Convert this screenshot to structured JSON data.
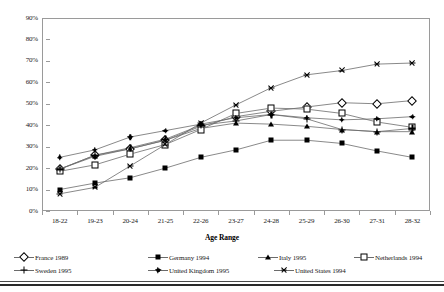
{
  "chart_data": {
    "type": "line",
    "title": "",
    "xlabel": "Age Range",
    "ylabel": "",
    "ylim": [
      0,
      90
    ],
    "grid": false,
    "legend_position": "bottom",
    "categories": [
      "18-22",
      "19-23",
      "20-24",
      "21-25",
      "22-26",
      "23-27",
      "24-28",
      "25-29",
      "26-30",
      "27-31",
      "28-32"
    ],
    "ytick_labels": [
      "90%",
      "80%",
      "70%",
      "60%",
      "50%",
      "40%",
      "30%",
      "20%",
      "10%",
      "0%"
    ],
    "ytick_values": [
      90,
      80,
      70,
      60,
      50,
      40,
      30,
      20,
      10,
      0
    ],
    "series": [
      {
        "name": "France 1989",
        "marker": "diamond-open",
        "values": [
          19.5,
          26.0,
          29.0,
          33.0,
          39.5,
          44.0,
          46.5,
          48.5,
          50.5,
          50.0,
          51.5
        ]
      },
      {
        "name": "Germany 1994",
        "marker": "square-filled",
        "values": [
          10.0,
          13.0,
          15.5,
          20.0,
          25.0,
          28.5,
          33.0,
          33.0,
          31.5,
          28.0,
          25.0
        ]
      },
      {
        "name": "Italy 1995",
        "marker": "triangle-filled",
        "values": [
          19.5,
          25.5,
          29.0,
          33.0,
          38.5,
          41.0,
          40.5,
          39.5,
          38.0,
          37.0,
          37.0
        ]
      },
      {
        "name": "Netherlands 1994",
        "marker": "square-open",
        "values": [
          18.5,
          21.5,
          26.5,
          31.0,
          38.0,
          45.5,
          48.0,
          47.5,
          45.5,
          41.5,
          39.0
        ]
      },
      {
        "name": "Sweden 1995",
        "marker": "starburst",
        "values": [
          19.5,
          26.0,
          29.5,
          33.5,
          40.0,
          42.0,
          45.0,
          43.0,
          38.0,
          37.0,
          38.5
        ]
      },
      {
        "name": "United Kingdom 1995",
        "marker": "dot-plus",
        "values": [
          25.0,
          28.5,
          34.5,
          37.5,
          40.5,
          43.5,
          45.0,
          43.5,
          42.5,
          43.0,
          44.0
        ]
      },
      {
        "name": "United States 1994",
        "marker": "cross",
        "values": [
          8.0,
          11.0,
          21.0,
          31.0,
          41.0,
          49.5,
          57.5,
          63.5,
          65.5,
          68.5,
          69.0
        ]
      }
    ]
  },
  "axis": {
    "x_title": "Age Range"
  },
  "legend": {
    "items": [
      {
        "label": "France 1989",
        "marker": "diamond-open"
      },
      {
        "label": "Germany 1994",
        "marker": "square-filled"
      },
      {
        "label": "Italy 1995",
        "marker": "triangle-filled"
      },
      {
        "label": "Netherlands 1994",
        "marker": "square-open"
      },
      {
        "label": "Sweden 1995",
        "marker": "starburst"
      },
      {
        "label": "United Kingdom 1995",
        "marker": "dot-plus"
      },
      {
        "label": "United States 1994",
        "marker": "cross"
      }
    ]
  },
  "colors": {
    "line": "#6b6b6b",
    "marker": "#000000",
    "frame": "#9a9a9a",
    "text": "#1a1a1a"
  }
}
